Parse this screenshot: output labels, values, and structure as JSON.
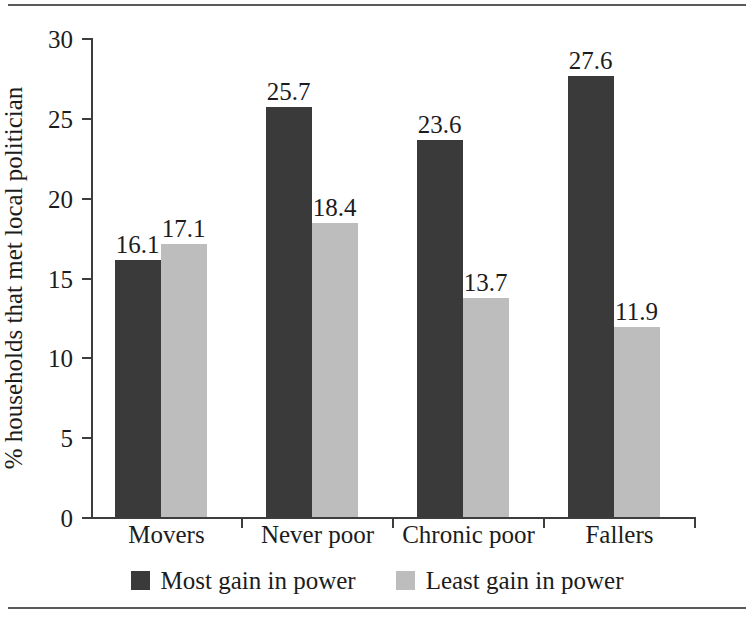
{
  "chart_data": {
    "type": "bar",
    "title": "",
    "xlabel": "",
    "ylabel": "% households that met local politician",
    "categories": [
      "Movers",
      "Never poor",
      "Chronic poor",
      "Fallers"
    ],
    "series": [
      {
        "name": "Most gain in power",
        "color": "#3a3a3a",
        "values": [
          16.1,
          25.7,
          23.6,
          27.6
        ]
      },
      {
        "name": "Least gain in power",
        "color": "#bdbdbd",
        "values": [
          17.1,
          18.4,
          13.7,
          11.9
        ]
      }
    ],
    "ylim": [
      0,
      30
    ],
    "yticks": [
      0,
      5,
      10,
      15,
      20,
      25,
      30
    ],
    "ytick_labels": [
      "0",
      "5",
      "10",
      "15",
      "20",
      "25",
      "30"
    ],
    "grid": false,
    "legend_position": "bottom",
    "data_labels": [
      [
        "16.1",
        "17.1"
      ],
      [
        "25.7",
        "18.4"
      ],
      [
        "23.6",
        "13.7"
      ],
      [
        "27.6",
        "11.9"
      ]
    ]
  }
}
